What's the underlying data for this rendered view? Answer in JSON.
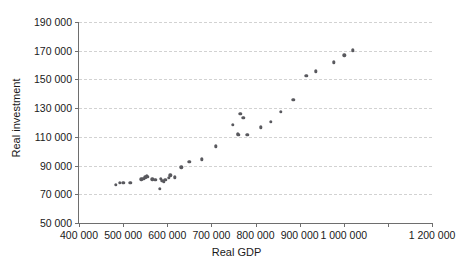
{
  "chart_data": {
    "type": "scatter",
    "title": "",
    "xlabel": "Real GDP",
    "ylabel": "Real investment",
    "xlim": [
      400000,
      1200000
    ],
    "ylim": [
      50000,
      190000
    ],
    "grid": true,
    "legend": null,
    "marker_color": "#59595e",
    "gridline_color": "#d2d2d2",
    "axis_color": "#6e6e6e",
    "xticks": [
      400000,
      500000,
      600000,
      700000,
      800000,
      900000,
      1000000,
      1100000,
      1200000
    ],
    "xtick_labels": [
      "400 000",
      "500 000",
      "600 000",
      "700 000",
      "800 000",
      "900 000",
      "1 000 000",
      "",
      "1 200 000"
    ],
    "yticks": [
      50000,
      70000,
      90000,
      110000,
      130000,
      150000,
      170000,
      190000
    ],
    "ytick_labels": [
      "50 000",
      "70 000",
      "90 000",
      "110 000",
      "130 000",
      "150 000",
      "170 000",
      "190 000"
    ],
    "series": [
      {
        "name": "Real investment vs Real GDP",
        "points": [
          [
            484000,
            76800
          ],
          [
            492000,
            78000
          ],
          [
            500000,
            78200
          ],
          [
            516000,
            77900
          ],
          [
            541000,
            80300
          ],
          [
            546000,
            80800
          ],
          [
            550000,
            81900
          ],
          [
            553000,
            82400
          ],
          [
            556000,
            82300
          ],
          [
            566000,
            80300
          ],
          [
            573000,
            80000
          ],
          [
            583000,
            73700
          ],
          [
            586000,
            80600
          ],
          [
            589000,
            79600
          ],
          [
            592000,
            78800
          ],
          [
            596000,
            79900
          ],
          [
            604000,
            81300
          ],
          [
            607000,
            83100
          ],
          [
            617000,
            81700
          ],
          [
            632000,
            88800
          ],
          [
            650000,
            92600
          ],
          [
            679000,
            94400
          ],
          [
            710000,
            103400
          ],
          [
            748000,
            118400
          ],
          [
            760000,
            112300
          ],
          [
            761000,
            111300
          ],
          [
            766000,
            126100
          ],
          [
            772000,
            123300
          ],
          [
            781000,
            111300
          ],
          [
            812000,
            116700
          ],
          [
            834000,
            120300
          ],
          [
            858000,
            127500
          ],
          [
            886000,
            135600
          ],
          [
            915000,
            152700
          ],
          [
            937000,
            155600
          ],
          [
            977000,
            161800
          ],
          [
            1001000,
            166900
          ],
          [
            1021000,
            170200
          ]
        ]
      }
    ]
  }
}
